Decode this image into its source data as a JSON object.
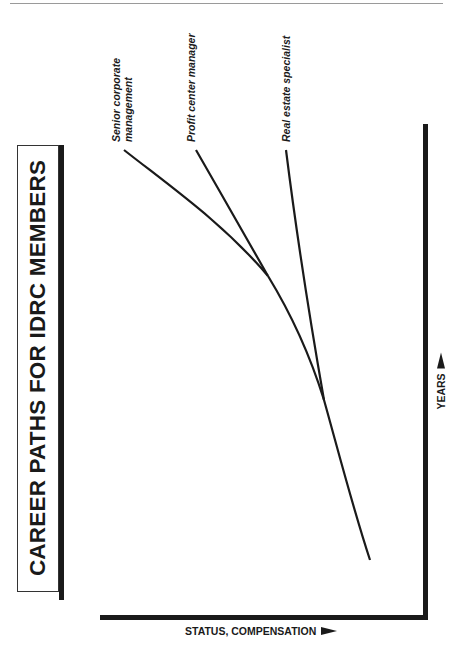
{
  "title": "CAREER PATHS FOR IDRC MEMBERS",
  "axes": {
    "x_label": "STATUS, COMPENSATION",
    "y_label": "YEARS",
    "x_arrow_icon": "right-arrow",
    "y_arrow_icon": "up-arrow"
  },
  "paths": [
    {
      "label_line1": "Senior corporate",
      "label_line2": "management"
    },
    {
      "label_line1": "Profit center manager"
    },
    {
      "label_line1": "Real estate specialist"
    }
  ],
  "colors": {
    "ink": "#1a1a1a",
    "background": "#ffffff",
    "rule": "#9a9a9a"
  }
}
